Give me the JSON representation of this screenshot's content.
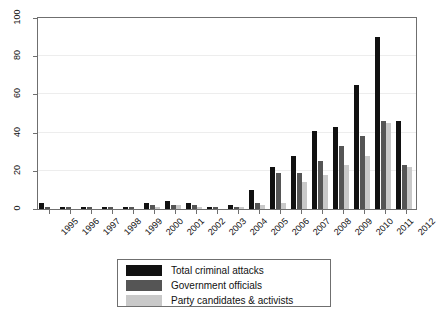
{
  "chart_data": {
    "type": "bar",
    "title": "",
    "subtitle": "",
    "xlabel": "",
    "ylabel": "",
    "ylim": [
      0,
      100
    ],
    "yticks": [
      0,
      20,
      40,
      60,
      80,
      100
    ],
    "grid": true,
    "legend_position": "bottom",
    "categories": [
      "1995",
      "1996",
      "1997",
      "1998",
      "1999",
      "2000",
      "2001",
      "2002",
      "2003",
      "2004",
      "2005",
      "2006",
      "2007",
      "2008",
      "2009",
      "2010",
      "2011",
      "2012"
    ],
    "series": [
      {
        "name": "Total criminal attacks",
        "color": "#111111",
        "values": [
          3,
          1,
          1,
          1,
          1,
          3,
          4,
          3,
          1,
          2,
          10,
          22,
          28,
          41,
          43,
          65,
          90,
          46
        ]
      },
      {
        "name": "Government officials",
        "color": "#555555",
        "values": [
          1,
          1,
          1,
          1,
          1,
          2,
          2,
          2,
          1,
          1,
          3,
          19,
          19,
          25,
          33,
          38,
          46,
          23
        ]
      },
      {
        "name": "Party candidates & activists",
        "color": "#c9c9c9",
        "values": [
          0,
          0,
          0,
          0,
          0,
          1,
          2,
          1,
          0,
          1,
          2,
          3,
          14,
          18,
          23,
          28,
          45,
          22
        ]
      }
    ]
  },
  "legend": {
    "items": [
      {
        "label": "Total criminal attacks",
        "color": "#111111"
      },
      {
        "label": "Government officials",
        "color": "#555555"
      },
      {
        "label": "Party candidates & activists",
        "color": "#c9c9c9"
      }
    ]
  },
  "axes": {
    "y_tick_labels": [
      "0",
      "20",
      "40",
      "60",
      "80",
      "100"
    ],
    "x_tick_labels": [
      "1995",
      "1996",
      "1997",
      "1998",
      "1999",
      "2000",
      "2001",
      "2002",
      "2003",
      "2004",
      "2005",
      "2006",
      "2007",
      "2008",
      "2009",
      "2010",
      "2011",
      "2012"
    ]
  }
}
